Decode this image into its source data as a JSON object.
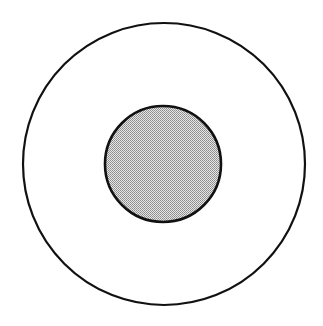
{
  "diagram": {
    "type": "concentric-circles",
    "width": 323,
    "height": 326,
    "outer_circle": {
      "cx": 164,
      "cy": 164,
      "r": 141,
      "fill": "#ffffff",
      "stroke": "#111111",
      "stroke_width": 2.2
    },
    "inner_circle": {
      "cx": 163,
      "cy": 164,
      "r": 58,
      "fill": "#c9c9c9",
      "stroke": "#111111",
      "stroke_width": 2.6,
      "pattern": "dithered-gray"
    }
  }
}
